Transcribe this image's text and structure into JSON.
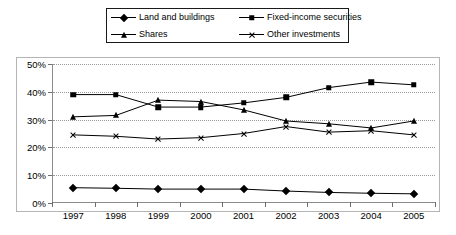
{
  "legend": {
    "entries": [
      {
        "label": "Land and buildings",
        "marker": "diamond-marker-icon"
      },
      {
        "label": "Fixed-income securities",
        "marker": "square-marker-icon"
      },
      {
        "label": "Shares",
        "marker": "triangle-marker-icon"
      },
      {
        "label": "Other investments",
        "marker": "cross-marker-icon"
      }
    ]
  },
  "axes": {
    "y_ticks": [
      "0%",
      "10%",
      "20%",
      "30%",
      "40%",
      "50%"
    ],
    "x_ticks": [
      "1997",
      "1998",
      "1999",
      "2000",
      "2001",
      "2002",
      "2003",
      "2004",
      "2005"
    ]
  },
  "chart_data": {
    "type": "line",
    "title": "",
    "xlabel": "",
    "ylabel": "",
    "ylim": [
      0,
      50
    ],
    "ytick_values": [
      0,
      10,
      20,
      30,
      40,
      50
    ],
    "grid": true,
    "legend_position": "top",
    "units": "percent",
    "categories": [
      "1997",
      "1998",
      "1999",
      "2000",
      "2001",
      "2002",
      "2003",
      "2004",
      "2005"
    ],
    "series": [
      {
        "name": "Land and buildings",
        "marker": "diamond",
        "color": "#000000",
        "values": [
          5.5,
          5.3,
          5.0,
          5.0,
          5.0,
          4.3,
          3.8,
          3.5,
          3.3
        ]
      },
      {
        "name": "Fixed-income securities",
        "marker": "square",
        "color": "#000000",
        "values": [
          39.0,
          39.0,
          34.5,
          34.5,
          36.0,
          38.0,
          41.5,
          43.5,
          42.5
        ]
      },
      {
        "name": "Shares",
        "marker": "triangle",
        "color": "#000000",
        "values": [
          31.0,
          31.5,
          37.0,
          36.5,
          33.5,
          29.5,
          28.5,
          27.0,
          29.5
        ]
      },
      {
        "name": "Other investments",
        "marker": "cross",
        "color": "#000000",
        "values": [
          24.5,
          24.0,
          23.0,
          23.5,
          25.0,
          27.5,
          25.5,
          26.0,
          24.5
        ]
      }
    ]
  }
}
